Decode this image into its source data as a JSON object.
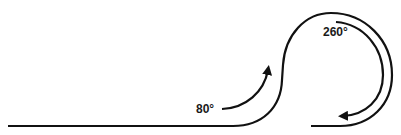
{
  "diagram": {
    "labels": {
      "turn1": "80°",
      "turn2": "260°"
    },
    "colors": {
      "stroke": "#111111",
      "background": "#ffffff"
    }
  }
}
